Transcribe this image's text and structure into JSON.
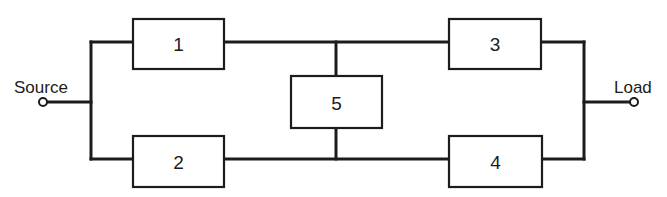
{
  "diagram": {
    "type": "bridge-network",
    "terminals": {
      "source": {
        "label": "Source"
      },
      "load": {
        "label": "Load"
      }
    },
    "blocks": [
      {
        "id": "1",
        "label": "1"
      },
      {
        "id": "2",
        "label": "2"
      },
      {
        "id": "3",
        "label": "3"
      },
      {
        "id": "4",
        "label": "4"
      },
      {
        "id": "5",
        "label": "5"
      }
    ],
    "connections": [
      [
        "source",
        "1"
      ],
      [
        "source",
        "2"
      ],
      [
        "1",
        "3"
      ],
      [
        "2",
        "4"
      ],
      [
        "1",
        "5"
      ],
      [
        "5",
        "2"
      ],
      [
        "3",
        "load"
      ],
      [
        "4",
        "load"
      ]
    ],
    "colors": {
      "line": "#1c1c1c",
      "background": "#ffffff"
    }
  }
}
